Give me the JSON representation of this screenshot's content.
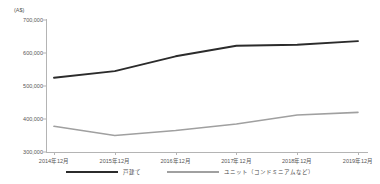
{
  "chart_data": {
    "type": "line",
    "title": "",
    "unit_label": "(A$)",
    "xlabel": "",
    "ylabel": "",
    "categories": [
      "2014年12月",
      "2015年12月",
      "2016年12月",
      "2017年12月",
      "2018年12月",
      "2019年12月"
    ],
    "yticks": [
      "300,000",
      "400,000",
      "500,000",
      "600,000",
      "700,000"
    ],
    "ylim": [
      300000,
      700000
    ],
    "grid": false,
    "legend_position": "bottom",
    "series": [
      {
        "name": "戸建て",
        "color": "#2b2b2b",
        "values": [
          525000,
          545000,
          590000,
          622000,
          625000,
          636000
        ]
      },
      {
        "name": "ユニット（コンドミニアムなど）",
        "color": "#a0a0a0",
        "values": [
          378000,
          350000,
          365000,
          385000,
          412000,
          420000
        ]
      }
    ]
  }
}
